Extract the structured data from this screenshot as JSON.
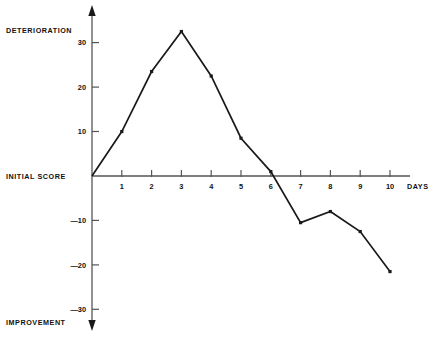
{
  "chart_data": {
    "type": "line",
    "title": "",
    "subtitle": "",
    "xlabel": "DAYS",
    "ylabel": "",
    "x": [
      0,
      1,
      2,
      3,
      4,
      5,
      6,
      7,
      8,
      9,
      10
    ],
    "values": [
      0,
      10,
      23.5,
      32.5,
      22.5,
      8.5,
      1,
      -10.5,
      -8,
      -12.5,
      -21.5
    ],
    "series": [
      {
        "name": "score",
        "values": [
          0,
          10,
          23.5,
          32.5,
          22.5,
          8.5,
          1,
          -10.5,
          -8,
          -12.5,
          -21.5
        ]
      }
    ],
    "xlim": [
      0,
      10.6
    ],
    "ylim": [
      -36,
      37
    ],
    "x_ticks": [
      "1",
      "2",
      "3",
      "4",
      "5",
      "6",
      "7",
      "8",
      "9",
      "10"
    ],
    "x_tick_values": [
      1,
      2,
      3,
      4,
      5,
      6,
      7,
      8,
      9,
      10
    ],
    "y_ticks": [
      "30",
      "20",
      "10",
      "—10",
      "—20",
      "—30"
    ],
    "y_tick_values": [
      30,
      20,
      10,
      -10,
      -20,
      -30
    ],
    "grid": false,
    "legend": false,
    "legend_position": "none",
    "marker": "square",
    "line_color": "#1a1a1a",
    "axis_color": "#555555",
    "annotations": {
      "top_left": "DETERIORATION",
      "origin_left": "INITIAL SCORE",
      "bottom_left": "IMPROVEMENT",
      "x_axis_title": "DAYS"
    }
  },
  "labels": {
    "deterioration": "DETERIORATION",
    "initial_score": "INITIAL SCORE",
    "improvement": "IMPROVEMENT",
    "days": "DAYS",
    "y_30": "30",
    "y_20": "20",
    "y_10": "10",
    "y_neg10": "—10",
    "y_neg20": "—20",
    "y_neg30": "—30",
    "x_1": "1",
    "x_2": "2",
    "x_3": "3",
    "x_4": "4",
    "x_5": "5",
    "x_6": "6",
    "x_7": "7",
    "x_8": "8",
    "x_9": "9",
    "x_10": "10"
  }
}
